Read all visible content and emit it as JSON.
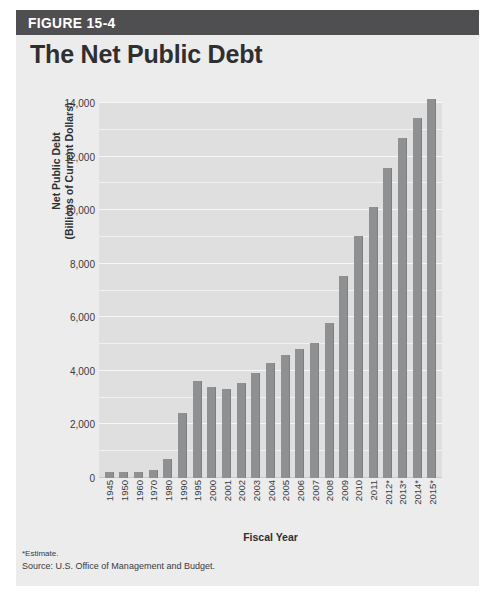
{
  "figure": {
    "number_label": "FIGURE 15-4",
    "title": "The Net Public Debt",
    "banner_color": "#4f4f51",
    "panel_color": "#ececed",
    "plot_color": "#dfdfe0",
    "bar_color": "#8f9091"
  },
  "footnotes": {
    "estimate": "*Estimate.",
    "source": "Source: U.S. Office of Management and Budget."
  },
  "chart_data": {
    "type": "bar",
    "title": "The Net Public Debt",
    "xlabel": "Fiscal Year",
    "ylabel": "Net Public Debt",
    "ylabel_line2": "(Billions of Current Dollars)",
    "ylim": [
      0,
      14000
    ],
    "yticks": [
      0,
      2000,
      4000,
      6000,
      8000,
      10000,
      12000,
      14000
    ],
    "ytick_labels": [
      "0",
      "2,000",
      "4,000",
      "6,000",
      "8,000",
      "10,000",
      "12,000",
      "14,000"
    ],
    "minor_gridline_interval": 1000,
    "grid": true,
    "legend": "none",
    "categories": [
      "1945",
      "1950",
      "1960",
      "1970",
      "1980",
      "1990",
      "1995",
      "2000",
      "2001",
      "2002",
      "2003",
      "2004",
      "2005",
      "2006",
      "2007",
      "2008",
      "2009",
      "2010",
      "2011",
      "2012*",
      "2013*",
      "2014*",
      "2015*"
    ],
    "values": [
      235,
      219,
      237,
      283,
      710,
      2412,
      3604,
      3410,
      3320,
      3540,
      3913,
      4296,
      4592,
      4829,
      5035,
      5803,
      7545,
      9019,
      10128,
      11578,
      12700,
      13450,
      14150
    ],
    "annotations": [
      "*Estimate."
    ]
  }
}
